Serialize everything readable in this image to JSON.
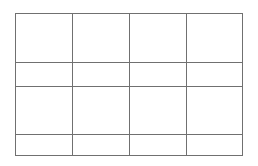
{
  "grid": {
    "rows": 4,
    "columns": 4,
    "line_color": "#707070",
    "background": "#ffffff",
    "cells": [
      [
        "",
        "",
        "",
        ""
      ],
      [
        "",
        "",
        "",
        ""
      ],
      [
        "",
        "",
        "",
        ""
      ],
      [
        "",
        "",
        "",
        ""
      ]
    ]
  }
}
